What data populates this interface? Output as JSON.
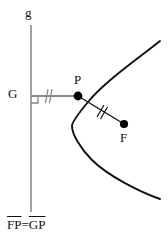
{
  "figure": {
    "background_color": "#ffffff",
    "width": 168,
    "height": 244
  },
  "colors": {
    "curve": "#111111",
    "directrix": "#8a8a8a",
    "segment_gp": "#8a8a8a",
    "segment_pf": "#111111",
    "point_fill": "#000000",
    "text": "#111111"
  },
  "labels": {
    "directrix_name": "g",
    "foot_point": "G",
    "curve_point": "P",
    "focus_point": "F"
  },
  "caption": {
    "left_segment": "FP",
    "equals": "=",
    "right_segment": "GP",
    "full_text": "FP=GP"
  },
  "geometry": {
    "directrix": {
      "x": 31,
      "y_top": 25,
      "y_bottom": 212
    },
    "point_G": {
      "x": 31,
      "y": 96
    },
    "point_P": {
      "x": 78,
      "y": 96
    },
    "point_F": {
      "x": 124,
      "y": 124
    },
    "vertex": {
      "x": 72,
      "y": 118
    },
    "right_angle_marker_size": 7,
    "tick_marks_gp": 2,
    "tick_marks_pf": 2,
    "parabola_path": "M 160,41 C 140,57 104,82 88,102 C 78,114 72,122 72,126 C 72,134 80,148 92,160 C 108,176 140,192 160,199",
    "parabola_opens": "right"
  }
}
